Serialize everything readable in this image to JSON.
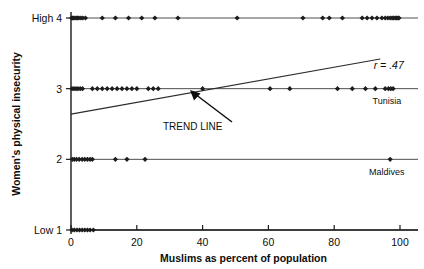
{
  "chart_data": {
    "type": "scatter",
    "title": "",
    "xlabel": "Muslims as percent of population",
    "ylabel": "Women's physical insecurity",
    "xlim": [
      0,
      100
    ],
    "ylim": [
      1,
      4
    ],
    "grid": false,
    "legend_position": "none",
    "xticks": [
      "0",
      "20",
      "40",
      "60",
      "80",
      "100"
    ],
    "xtick_values": [
      0,
      20,
      40,
      60,
      80,
      100
    ],
    "yticks": [
      "Low 1",
      "2",
      "3",
      "High 4"
    ],
    "ytick_values": [
      1,
      2,
      3,
      4
    ],
    "annotations": [
      {
        "text": "r = .47",
        "x": 92,
        "y": 3.28
      },
      {
        "text": "TREND LINE",
        "x": 37,
        "y": 2.42
      },
      {
        "text": "Tunisia",
        "x": 96,
        "y": 2.78
      },
      {
        "text": "Maldives",
        "x": 96,
        "y": 1.78
      }
    ],
    "trendline": {
      "label": "TREND LINE",
      "correlation": "r = .47",
      "r_value": 0.47,
      "x0": 0,
      "y0": 2.64,
      "x1": 94,
      "y1": 3.42
    },
    "series": [
      {
        "name": "High 4",
        "y": 4,
        "x": [
          0.2,
          0.5,
          0.8,
          1.2,
          1.6,
          2.0,
          2.4,
          3.0,
          3.6,
          4.4,
          9.5,
          13.5,
          17.5,
          21.5,
          25.5,
          32.5,
          50.5,
          70.5,
          76.5,
          78.5,
          82.5,
          88.5,
          90.0,
          91.5,
          93.0,
          94.5,
          95.5,
          96.3,
          97.0,
          97.6,
          98.1,
          98.6,
          99.0,
          99.4,
          99.7
        ]
      },
      {
        "name": "Level 3",
        "y": 3,
        "x": [
          0.3,
          0.9,
          1.5,
          2.1,
          2.8,
          3.5,
          6.5,
          8.0,
          9.5,
          11.0,
          12.5,
          14.0,
          15.5,
          17.0,
          18.5,
          20.0,
          23.5,
          25.0,
          26.5,
          40.0,
          60.5,
          66.5,
          81.0,
          85.5,
          89.5,
          92.5,
          95.5,
          96.5,
          97.2,
          97.9
        ]
      },
      {
        "name": "Level 2",
        "y": 2,
        "x": [
          0.4,
          1.0,
          1.7,
          2.5,
          3.4,
          4.2,
          5.0,
          5.8,
          6.5,
          13.5,
          17.0,
          22.5,
          97.0
        ]
      },
      {
        "name": "Low 1",
        "y": 1,
        "x": [
          0.3,
          1.0,
          1.8,
          2.6,
          3.4,
          4.2,
          5.0,
          5.8,
          6.8
        ]
      }
    ],
    "labeled_points": [
      {
        "label": "Tunisia",
        "x": 98,
        "y": 3
      },
      {
        "label": "Maldives",
        "x": 97,
        "y": 2
      }
    ]
  }
}
